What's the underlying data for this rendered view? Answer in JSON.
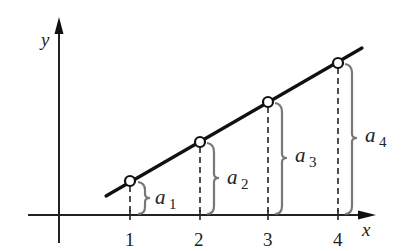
{
  "diagram": {
    "axes": {
      "x_label": "x",
      "y_label": "y",
      "x_ticks": [
        "1",
        "2",
        "3",
        "4"
      ]
    },
    "points": [
      {
        "x": 1,
        "label": "a",
        "sub": "1"
      },
      {
        "x": 2,
        "label": "a",
        "sub": "2"
      },
      {
        "x": 3,
        "label": "a",
        "sub": "3"
      },
      {
        "x": 4,
        "label": "a",
        "sub": "4"
      }
    ],
    "colors": {
      "line": "#111111",
      "brace": "#777777",
      "dashed": "#222222",
      "background": "#ffffff"
    }
  }
}
